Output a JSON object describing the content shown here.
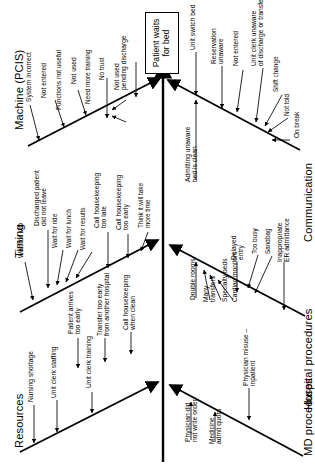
{
  "diagram": {
    "type": "fishbone",
    "orientation": "rotated-90-ccw",
    "effect": "Patient waits\nfor bed",
    "effect_plain": "Patient waits for bed",
    "categories": [
      {
        "id": "machine",
        "label": "Machine (PCIS)",
        "side": "left",
        "causes": [
          {
            "text": "System incorrect"
          },
          {
            "text": "Not entered"
          },
          {
            "text": "Functions not useful"
          },
          {
            "text": "Not used",
            "subs": [
              {
                "text": "Need more training"
              },
              {
                "text": "No trust"
              }
            ]
          },
          {
            "text": "Not used\npending discharge"
          }
        ]
      },
      {
        "id": "timing",
        "label": "Timing",
        "side": "left",
        "causes": [
          {
            "text": "Wait for MD"
          },
          {
            "text": "Discharged patient\ndid not leave",
            "subs": [
              {
                "text": "Wait for ride"
              },
              {
                "text": "Wait for lunch"
              },
              {
                "text": "Wait for results"
              }
            ]
          },
          {
            "text": "Call housekeeping\ntoo late"
          },
          {
            "text": "Call housekeeping\ntoo early",
            "subs": [
              {
                "text": "Think it will take\nmore time"
              }
            ]
          }
        ]
      },
      {
        "id": "resources",
        "label": "Resources",
        "side": "left",
        "causes": [
          {
            "text": "Nursing shortage"
          },
          {
            "text": "Unit clerk staffing"
          },
          {
            "text": "Unit clerk training"
          },
          {
            "text": "Patient arrives\ntoo early"
          },
          {
            "text": "Transfer too early\nfrom another hospital"
          },
          {
            "text": "Call housekeeping\nwhen clean"
          }
        ]
      },
      {
        "id": "communication",
        "label": "Communication",
        "side": "right",
        "causes": [
          {
            "text": "Unit switch bed"
          },
          {
            "text": "Reservation\nunaware"
          },
          {
            "text": "Not entered"
          },
          {
            "text": "Unit clerk unaware\nof discharge or transfer",
            "subs": [
              {
                "text": "Shift change"
              },
              {
                "text": "Not told"
              },
              {
                "text": "On break"
              }
            ]
          },
          {
            "text": "Admitting unaware\nbed is clean"
          }
        ]
      },
      {
        "id": "hospital-procedures",
        "label": "Hospital procedures",
        "side": "right",
        "causes": [
          {
            "text": "Double rooms"
          },
          {
            "text": "Many\ntransfers"
          },
          {
            "text": "Specialty beds"
          },
          {
            "text": "Cardiac monitors"
          },
          {
            "text": "Delayed\nentry",
            "subs": [
              {
                "text": "Too busy"
              },
              {
                "text": "Sandbag"
              }
            ]
          },
          {
            "text": "Inappropriate\nER admittance"
          }
        ]
      },
      {
        "id": "md-procedures",
        "label": "MD procedures",
        "side": "right",
        "causes": [
          {
            "text": "Physician did\nnot write order"
          },
          {
            "text": "Medicine\nadmit quota"
          },
          {
            "text": "Physician misuse –\ninpatient"
          }
        ]
      }
    ]
  },
  "labels": {
    "machine": "Machine (PCIS)",
    "timing": "Timing",
    "resources": "Resources",
    "communication": "Communication",
    "hospital": "Hospital procedures",
    "md": "MD procedures",
    "effect_l1": "Patient waits",
    "effect_l2": "for bed",
    "m_c1": "System incorrect",
    "m_c2": "Not entered",
    "m_c3": "Functions not useful",
    "m_c4": "Not used",
    "m_s1": "Need more training",
    "m_s2": "No trust",
    "m_c5a": "Not used",
    "m_c5b": "pending discharge",
    "t_c1": "Wait for MD",
    "t_c2a": "Discharged patient",
    "t_c2b": "did not leave",
    "t_s1": "Wait for ride",
    "t_s2": "Wait for lunch",
    "t_s3": "Wait for results",
    "t_c3a": "Call housekeeping",
    "t_c3b": "too late",
    "t_c4a": "Call housekeeping",
    "t_c4b": "too early",
    "t_s4a": "Think it will take",
    "t_s4b": "more time",
    "r_c1": "Nursing shortage",
    "r_c2": "Unit clerk staffing",
    "r_c3": "Unit clerk training",
    "r_c4a": "Patient arrives",
    "r_c4b": "too early",
    "r_c5a": "Transfer too early",
    "r_c5b": "from another hospital",
    "r_c6a": "Call housekeeping",
    "r_c6b": "when clean",
    "c_c1": "Unit switch bed",
    "c_c2a": "Reservation",
    "c_c2b": "unaware",
    "c_c3": "Not entered",
    "c_c4a": "Unit clerk unaware",
    "c_c4b": "of discharge or transfer",
    "c_s1": "Shift change",
    "c_s2": "Not told",
    "c_s3": "On break",
    "c_c5a": "Admitting unaware",
    "c_c5b": "bed is clean",
    "h_c1": "Double rooms",
    "h_c2a": "Many",
    "h_c2b": "transfers",
    "h_c3": "Specialty beds",
    "h_c4": "Cardiac monitors",
    "h_c5a": "Delayed",
    "h_c5b": "entry",
    "h_s1": "Too busy",
    "h_s2": "Sandbag",
    "h_c6a": "Inappropriate",
    "h_c6b": "ER admittance",
    "d_c1a": "Physician did",
    "d_c1b": "not write order",
    "d_c2a": "Medicine",
    "d_c2b": "admit quota",
    "d_c3a": "Physician misuse –",
    "d_c3b": "inpatient"
  },
  "colors": {
    "line": "#000000",
    "background": "#ffffff",
    "text": "#000000"
  }
}
